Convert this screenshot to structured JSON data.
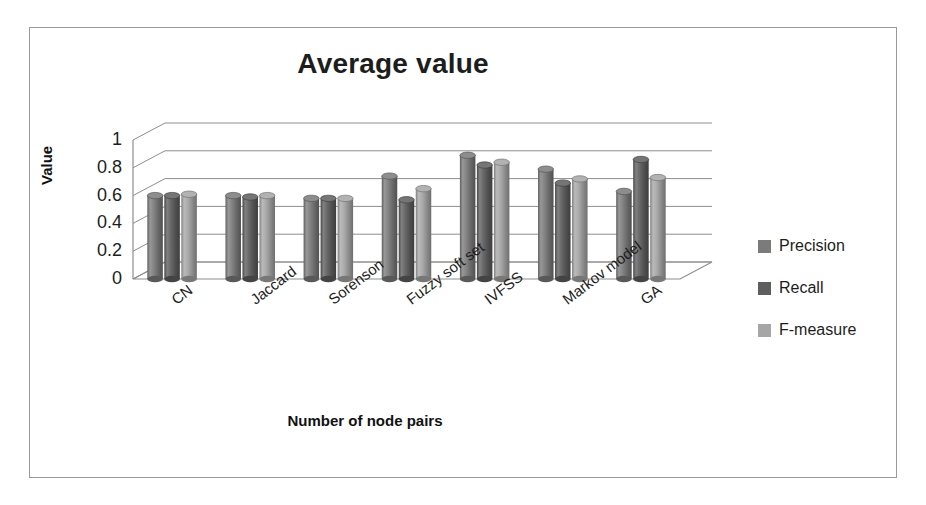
{
  "chart_data": {
    "type": "bar",
    "title": "Average value",
    "xlabel": "Number of node pairs",
    "ylabel": "Value",
    "ylim": [
      0,
      1
    ],
    "yticks": [
      "0",
      "0.2",
      "0.4",
      "0.6",
      "0.8",
      "1"
    ],
    "ytick_values": [
      0,
      0.2,
      0.4,
      0.6,
      0.8,
      1
    ],
    "grid": true,
    "legend_position": "right",
    "style": "3d-cylinder",
    "categories": [
      "CN",
      "Jaccard",
      "Sorenson",
      "Fuzzy soft set",
      "IVFSS",
      "Markov model",
      "GA"
    ],
    "series": [
      {
        "name": "Precision",
        "color": "#7b7b7b",
        "values": [
          0.6,
          0.6,
          0.58,
          0.74,
          0.89,
          0.79,
          0.63
        ]
      },
      {
        "name": "Recall",
        "color": "#5e5e5e",
        "values": [
          0.6,
          0.59,
          0.58,
          0.57,
          0.82,
          0.69,
          0.86
        ]
      },
      {
        "name": "F-measure",
        "color": "#a6a6a6",
        "values": [
          0.61,
          0.6,
          0.58,
          0.65,
          0.84,
          0.72,
          0.73
        ]
      }
    ]
  },
  "axes": {
    "y_title": "Value",
    "x_title": "Number of node pairs"
  },
  "title": {
    "text": "Average value"
  },
  "legend": {
    "items": [
      {
        "label": "Precision",
        "color": "#7b7b7b"
      },
      {
        "label": "Recall",
        "color": "#5e5e5e"
      },
      {
        "label": "F-measure",
        "color": "#a6a6a6"
      }
    ]
  },
  "colors": {
    "frame": "#9a9a9a",
    "grid": "#8e8e8e",
    "text": "#1d1d1d",
    "background": "#ffffff"
  }
}
